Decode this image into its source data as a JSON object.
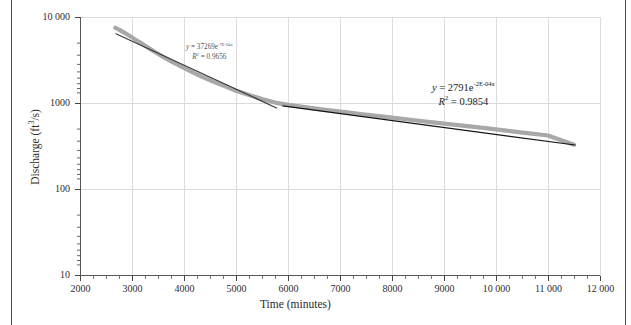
{
  "figure": {
    "type": "scatter-with-trendlines",
    "background": "#ffffff"
  },
  "chart_data": {
    "type": "line",
    "title": "",
    "subtitle": "",
    "xlabel": "Time (minutes)",
    "ylabel": "Discharge (ft3/s)",
    "ylabel_parts": {
      "text": "Discharge (ft",
      "sup": "3",
      "tail": "/s)"
    },
    "xscale": "linear",
    "yscale": "log",
    "xlim": [
      2000,
      12000
    ],
    "ylim": [
      10,
      10000
    ],
    "grid": true,
    "grid_color": "#d9d9d9",
    "legend": "none",
    "xticks": [
      2000,
      3000,
      4000,
      5000,
      6000,
      7000,
      8000,
      9000,
      10000,
      11000,
      12000
    ],
    "xticklabels": [
      "2000",
      "3000",
      "4000",
      "5000",
      "6000",
      "7000",
      "8000",
      "9000",
      "10 000",
      "11 000",
      "12 000"
    ],
    "yticks": [
      10,
      100,
      1000,
      10000
    ],
    "yticklabels": [
      "10",
      "100",
      "1000",
      "10 000"
    ],
    "minor_ticks_y": true,
    "series": [
      {
        "name": "Discharge recession",
        "color": "#a8a8a8",
        "style": "thick-line",
        "x": [
          2680,
          2760,
          2850,
          2950,
          3060,
          3180,
          3300,
          3450,
          3600,
          3780,
          3960,
          4150,
          4350,
          4560,
          4780,
          5000,
          5250,
          5500,
          5750,
          6000,
          6250,
          6500,
          6800,
          7100,
          7400,
          7700,
          8000,
          8350,
          8700,
          9050,
          9400,
          9800,
          10200,
          10600,
          11000,
          11500
        ],
        "y": [
          7500,
          7100,
          6600,
          6050,
          5500,
          4950,
          4450,
          3900,
          3450,
          3000,
          2650,
          2320,
          2030,
          1790,
          1580,
          1400,
          1250,
          1120,
          1020,
          960,
          915,
          875,
          830,
          790,
          750,
          715,
          682,
          645,
          610,
          578,
          548,
          515,
          482,
          452,
          424,
          332
        ]
      },
      {
        "name": "Trendline segment 1",
        "color": "#3a3a3a",
        "style": "thin-line",
        "x": [
          2690,
          5780
        ],
        "y": [
          6400,
          885
        ],
        "equation": "y = 37269e^-7E-04x",
        "r2": 0.9656
      },
      {
        "name": "Trendline segment 2",
        "color": "#141414",
        "style": "thin-line",
        "x": [
          5900,
          11520
        ],
        "y": [
          933,
          329
        ],
        "equation": "y = 2791e^-2E-04x",
        "r2": 0.9854
      }
    ],
    "annotations": [
      {
        "id": "annot-1",
        "eq_lead": "y",
        "eq_eq": " = ",
        "eq_coef": "37269e",
        "eq_exp": "-7E-04x",
        "r2_lead": "R",
        "r2_sup": "2",
        "r2_val": " = 0.9656",
        "color": "#555555"
      },
      {
        "id": "annot-2",
        "eq_lead": "y",
        "eq_eq": " = ",
        "eq_coef": "2791e",
        "eq_exp": "-2E-04x",
        "r2_lead": "R",
        "r2_sup": "2",
        "r2_val": " = 0.9854",
        "color": "#1a1a1a"
      }
    ]
  }
}
